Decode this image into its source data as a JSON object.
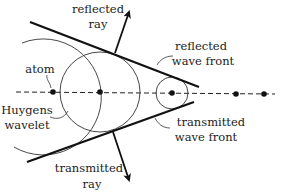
{
  "figure": {
    "labels": {
      "reflected_ray": [
        "reflected",
        "ray"
      ],
      "reflected_wave_front": [
        "reflected",
        "wave front"
      ],
      "atom": "atom",
      "huygens_wavelet": [
        "Huygens",
        "wavelet"
      ],
      "transmitted_wave_front": [
        "transmitted",
        "wave front"
      ],
      "transmitted_ray": [
        "transmitted",
        "ray"
      ]
    },
    "colors": {
      "ink": "#111111",
      "thin_line": "#333333",
      "background": "#ffffff"
    },
    "atoms": [
      {
        "x": 53,
        "y": 92
      },
      {
        "x": 100,
        "y": 92
      },
      {
        "x": 172,
        "y": 93
      },
      {
        "x": 236,
        "y": 94
      },
      {
        "x": 264,
        "y": 94
      }
    ],
    "wavelets": [
      {
        "cx": 53,
        "cy": 92,
        "r": 58
      },
      {
        "cx": 100,
        "cy": 92,
        "r": 40
      },
      {
        "cx": 172,
        "cy": 93,
        "r": 16
      }
    ]
  }
}
